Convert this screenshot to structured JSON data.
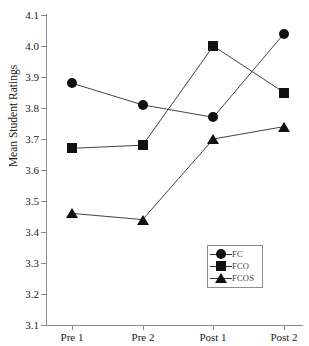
{
  "chart_data": {
    "type": "line",
    "title": "",
    "xlabel": "",
    "ylabel": "Mean Student Ratings",
    "categories": [
      "Pre 1",
      "Pre 2",
      "Post 1",
      "Post 2"
    ],
    "ylim": [
      3.1,
      4.1
    ],
    "ytick_labels": [
      "4.1",
      "4.0",
      "3.9",
      "3.8",
      "3.7",
      "3.6",
      "3.5",
      "3.4",
      "3.3",
      "3.2",
      "3.1"
    ],
    "ytick_values": [
      4.1,
      4.0,
      3.9,
      3.8,
      3.7,
      3.6,
      3.5,
      3.4,
      3.3,
      3.2,
      3.1
    ],
    "grid": false,
    "legend_position": "lower-right",
    "series": [
      {
        "name": "FC",
        "marker": "circle",
        "values": [
          3.88,
          3.81,
          3.77,
          4.04
        ]
      },
      {
        "name": "FCO",
        "marker": "square",
        "values": [
          3.67,
          3.68,
          4.0,
          3.85
        ]
      },
      {
        "name": "FCOS",
        "marker": "triangle",
        "values": [
          3.46,
          3.44,
          3.7,
          3.74
        ]
      }
    ],
    "line_color": "#444444",
    "marker_color": "#111111"
  },
  "legend": {
    "items": [
      {
        "label": "FC"
      },
      {
        "label": "FCO"
      },
      {
        "label": "FCOS"
      }
    ]
  },
  "axes": {
    "y_title": "Mean Student Ratings"
  }
}
